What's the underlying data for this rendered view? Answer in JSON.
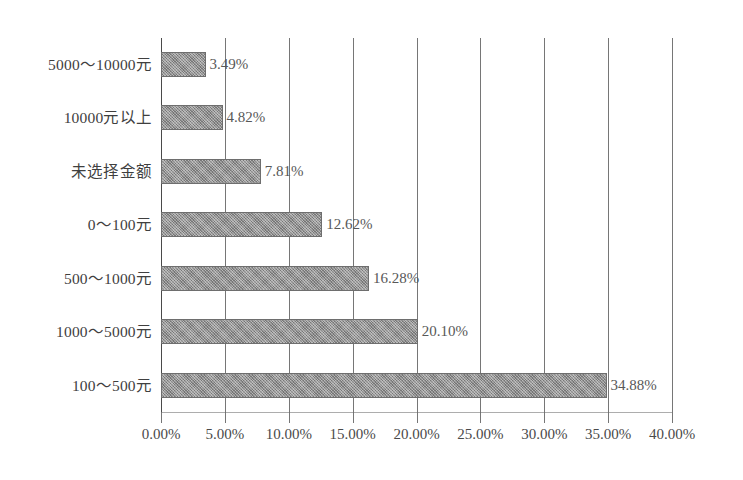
{
  "chart_data": {
    "type": "bar",
    "orientation": "horizontal",
    "title": "",
    "subtitle": "",
    "xlabel": "",
    "ylabel": "",
    "xlim": [
      0,
      40
    ],
    "ylim": null,
    "grid": true,
    "legend": null,
    "legend_position": "none",
    "categories": [
      "5000～10000元",
      "10000元以上",
      "未选择金额",
      "0～100元",
      "500～1000元",
      "1000～5000元",
      "100～500元"
    ],
    "values": [
      3.49,
      4.82,
      7.81,
      12.62,
      16.28,
      20.1,
      34.88
    ],
    "data_labels": [
      "3.49%",
      "4.82%",
      "7.81%",
      "12.62%",
      "16.28%",
      "20.10%",
      "34.88%"
    ],
    "xticks": [
      0,
      5,
      10,
      15,
      20,
      25,
      30,
      35,
      40
    ],
    "xtick_labels": [
      "0.00%",
      "5.00%",
      "10.00%",
      "15.00%",
      "20.00%",
      "25.00%",
      "30.00%",
      "35.00%",
      "40.00%"
    ],
    "bar_color": "#8d8d8d",
    "bar_edge_color": "#6e6e6e",
    "gridline_color": "#5e5e5e",
    "text_color": "#4a4a4a",
    "background_color": "#ffffff"
  }
}
